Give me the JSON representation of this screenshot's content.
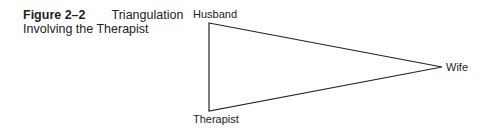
{
  "caption": {
    "figure_label": "Figure 2–2",
    "title_line1": "Triangulation",
    "title_line2": "Involving the Therapist"
  },
  "diagram": {
    "type": "triangle",
    "nodes": [
      {
        "id": "husband",
        "label": "Husband"
      },
      {
        "id": "wife",
        "label": "Wife"
      },
      {
        "id": "therapist",
        "label": "Therapist"
      }
    ],
    "edges": [
      [
        "husband",
        "wife"
      ],
      [
        "wife",
        "therapist"
      ],
      [
        "therapist",
        "husband"
      ]
    ],
    "line_color": "#222222"
  }
}
